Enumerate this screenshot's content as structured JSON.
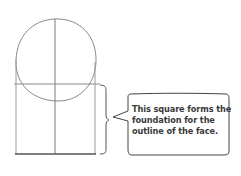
{
  "diagram": {
    "type": "face-construction-sketch",
    "shapes": [
      {
        "name": "head-circle",
        "kind": "circle-sketch"
      },
      {
        "name": "center-vertical-line",
        "kind": "line"
      },
      {
        "name": "horizontal-guide-line",
        "kind": "line"
      },
      {
        "name": "face-square",
        "kind": "rectangle"
      },
      {
        "name": "brace",
        "kind": "curly-brace"
      }
    ],
    "colors": {
      "stroke": "#8a8a8a",
      "stroke_dark": "#555555",
      "text": "#3a3a3a",
      "background": "#ffffff"
    }
  },
  "callout": {
    "lines": [
      "This square forms the",
      "foundation for the",
      "outline of the face."
    ]
  }
}
